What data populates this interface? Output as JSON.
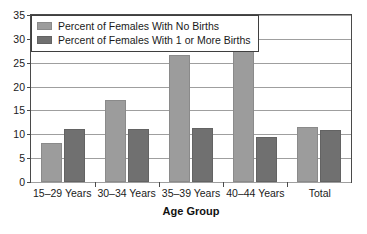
{
  "chart_data": {
    "type": "bar",
    "title": "",
    "xlabel": "Age Group",
    "ylabel": "",
    "categories": [
      "15–29 Years",
      "30–34 Years",
      "35–39 Years",
      "40–44 Years",
      "Total"
    ],
    "series": [
      {
        "name": "Percent of Females With No Births",
        "color": "#9c9c9c",
        "values": [
          8.2,
          17.1,
          26.7,
          30.5,
          11.5
        ]
      },
      {
        "name": "Percent of Females With 1 or More Births",
        "color": "#707070",
        "values": [
          11.1,
          11.1,
          11.4,
          9.5,
          11.0
        ]
      }
    ],
    "ylim": [
      0,
      35
    ],
    "ytick_step": 5,
    "yticks": [
      "0",
      "5",
      "10",
      "15",
      "20",
      "25",
      "30",
      "35"
    ],
    "grid": true,
    "legend_position": "upper-left"
  }
}
